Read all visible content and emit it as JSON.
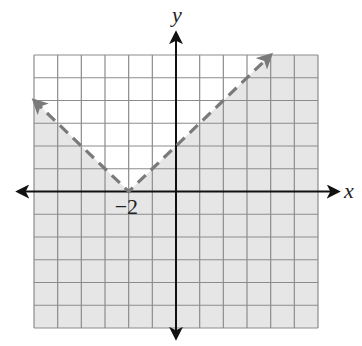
{
  "chart_data": {
    "type": "line",
    "title": "",
    "xlabel": "x",
    "ylabel": "y",
    "xlim": [
      -6,
      6
    ],
    "ylim": [
      -6,
      6
    ],
    "grid": true,
    "grid_step": 1,
    "boundary": {
      "equation": "y = |x + 2|",
      "style": "dashed",
      "color": "#7a7a7a",
      "points": [
        [
          -6,
          4
        ],
        [
          -2,
          0
        ],
        [
          4,
          6
        ]
      ],
      "vertex": [
        -2,
        0
      ]
    },
    "shaded_region": "below boundary (y < |x + 2|)",
    "shade_color": "#e6e6e6",
    "annotations": [
      {
        "text": "−2",
        "x": -2,
        "y": 0
      }
    ]
  },
  "labels": {
    "x_axis": "x",
    "y_axis": "y",
    "vertex_tick": "−2"
  },
  "colors": {
    "grid": "#8c8c8c",
    "axis": "#111111",
    "shade": "#e6e6e6",
    "boundary": "#7a7a7a"
  }
}
